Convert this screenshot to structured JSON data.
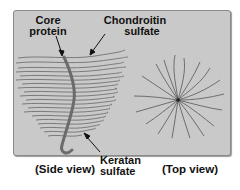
{
  "figure": {
    "labels": {
      "core_protein": [
        "Core",
        "protein"
      ],
      "chondroitin_sulfate": [
        "Chondroitin",
        "sulfate"
      ],
      "keratan_sulfate": [
        "Keratan",
        "sulfate"
      ],
      "side_view": "(Side view)",
      "top_view": "(Top view)"
    },
    "colors": {
      "panel_background": "#c9c9c9",
      "panel_border": "#8a8a8a",
      "chain_stroke": "#555555",
      "core_protein_stroke": "#6b6b6b",
      "label_text": "#111111"
    }
  }
}
